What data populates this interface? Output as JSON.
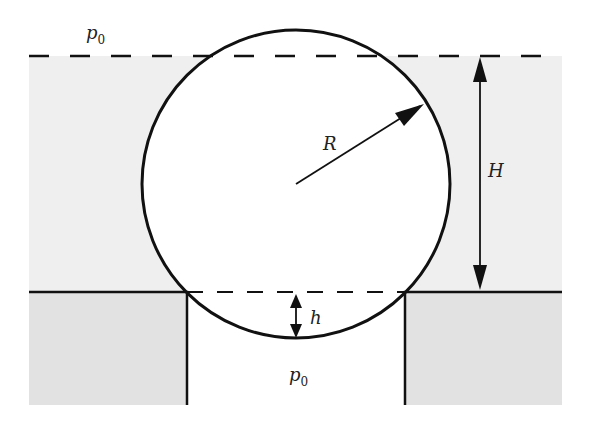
{
  "diagram": {
    "labels": {
      "p0_top": "p",
      "p0_top_sub": "0",
      "p0_bottom": "p",
      "p0_bottom_sub": "0",
      "radius": "R",
      "depth": "H",
      "protrusion": "h"
    },
    "colors": {
      "liquid": "#efefef",
      "solid": "#e2e2e2",
      "stroke": "#111111",
      "background": "#ffffff"
    },
    "geometry": {
      "sphere_center": [
        296,
        184
      ],
      "sphere_radius": 154,
      "free_surface_y": 55,
      "wall_top_y": 292,
      "hole_left_x": 187,
      "hole_right_x": 405,
      "bottom_y": 405,
      "left_x": 29,
      "right_x": 562
    }
  }
}
